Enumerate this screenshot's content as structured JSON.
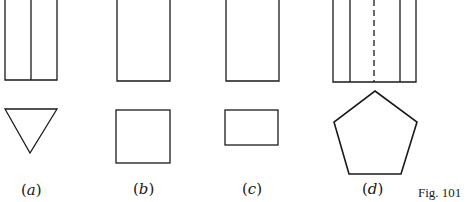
{
  "figure": {
    "caption": "Fig. 101",
    "stroke_color": "#1a1a1a",
    "background": "#ffffff",
    "panels": [
      {
        "label": "(a)",
        "elevation": "rectangle with one vertical centre line",
        "plan": "downward-pointing equilateral triangle"
      },
      {
        "label": "(b)",
        "elevation": "plain rectangle",
        "plan": "square"
      },
      {
        "label": "(c)",
        "elevation": "plain rectangle",
        "plan": "rectangle (wider than tall)"
      },
      {
        "label": "(d)",
        "elevation": "rectangle with two solid vertical lines and one dashed centre line",
        "plan": "regular pentagon (apex up)"
      }
    ]
  }
}
